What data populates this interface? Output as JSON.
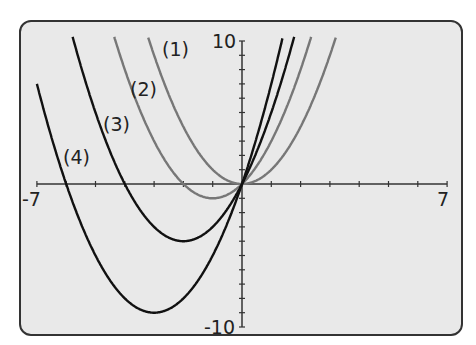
{
  "chart_data": {
    "type": "line",
    "title": "",
    "xlabel": "",
    "ylabel": "",
    "xlim": [
      -7,
      7
    ],
    "ylim": [
      -10,
      10
    ],
    "x_tick_labels": [
      "-7",
      "7"
    ],
    "y_tick_labels": [
      "10",
      "-10"
    ],
    "x_tick_step": 1,
    "y_tick_step": 1,
    "grid": false,
    "series": [
      {
        "name": "(1)",
        "label": "(1)",
        "color": "#777777",
        "equation": "y = x^2",
        "vertex": [
          0,
          0
        ]
      },
      {
        "name": "(2)",
        "label": "(2)",
        "color": "#777777",
        "equation": "y = x^2 + 2x",
        "vertex": [
          -1,
          -1
        ]
      },
      {
        "name": "(3)",
        "label": "(3)",
        "color": "#111111",
        "equation": "y = x^2 + 4x",
        "vertex": [
          -2,
          -4
        ]
      },
      {
        "name": "(4)",
        "label": "(4)",
        "color": "#111111",
        "equation": "y = x^2 + 6x",
        "vertex": [
          -3,
          -9
        ]
      }
    ]
  },
  "labels": {
    "x_min": "-7",
    "x_max": "7",
    "y_max": "10",
    "y_min": "-10",
    "c1": "(1)",
    "c2": "(2)",
    "c3": "(3)",
    "c4": "(4)"
  }
}
